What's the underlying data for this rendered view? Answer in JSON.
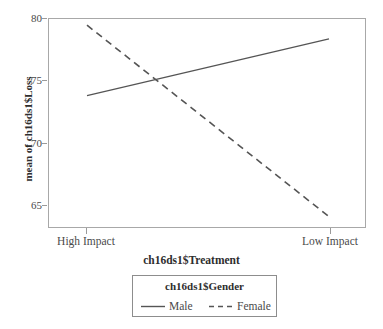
{
  "chart_data": {
    "type": "line",
    "title": "",
    "subtitle": "",
    "xlabel": "ch16ds1$Treatment",
    "ylabel": "mean of ch16ds1$Loss",
    "categories": [
      "High Impact",
      "Low Impact"
    ],
    "x": [
      0,
      1
    ],
    "xlim": [
      0,
      1
    ],
    "ylim": [
      63.0,
      80.0
    ],
    "yticks": [
      65,
      70,
      75,
      80
    ],
    "ytick_labels": [
      "65",
      "70",
      "75",
      "80"
    ],
    "grid": false,
    "legend_position": "bottom-center",
    "legend_title": "ch16ds1$Gender",
    "series": [
      {
        "name": "Male",
        "values": [
          73.8,
          78.4
        ],
        "linestyle": "solid",
        "color": "#555555"
      },
      {
        "name": "Female",
        "values": [
          79.5,
          64.0
        ],
        "linestyle": "dashed",
        "color": "#555555"
      }
    ],
    "annotations": []
  },
  "axes": {
    "y_tick_labels": [
      "80",
      "75",
      "70",
      "65"
    ],
    "x_tick_labels": [
      "High Impact",
      "Low Impact"
    ],
    "y_axis_title": "mean of ch16ds1$Loss",
    "x_axis_title": "ch16ds1$Treatment"
  },
  "legend": {
    "title": "ch16ds1$Gender",
    "entries": [
      {
        "label": "Male",
        "style": "solid-line-icon"
      },
      {
        "label": "Female",
        "style": "dashed-line-icon"
      }
    ]
  },
  "colors": {
    "panel_border": "#a8a8a8",
    "axis": "#9a9a9a",
    "line": "#555555",
    "text": "#4a4a4a",
    "title_text": "#2e2e2e",
    "legend_border": "#8d8d8d",
    "background": "#ffffff"
  }
}
